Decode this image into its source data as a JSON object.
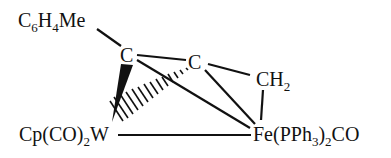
{
  "diagram": {
    "type": "chemical-structure",
    "atoms": {
      "aryl": {
        "main": "C",
        "sub1": "6",
        "mid": "H",
        "sub2": "4",
        "tail": "Me"
      },
      "c1": {
        "label": "C"
      },
      "c2": {
        "label": "C"
      },
      "ch2": {
        "main": "CH",
        "sub": "2"
      },
      "w": {
        "pre": "Cp(CO)",
        "sub": "2",
        "post": "W"
      },
      "fe": {
        "pre": "Fe(PPh",
        "sub1": "3",
        "mid": ")",
        "sub2": "2",
        "post": "CO"
      }
    },
    "bonds": [
      {
        "from": "aryl",
        "to": "c1",
        "style": "single"
      },
      {
        "from": "c1",
        "to": "c2",
        "style": "single"
      },
      {
        "from": "c1",
        "to": "w",
        "style": "wedge"
      },
      {
        "from": "c1",
        "to": "fe",
        "style": "single"
      },
      {
        "from": "c2",
        "to": "ch2",
        "style": "single"
      },
      {
        "from": "c2",
        "to": "fe",
        "style": "single"
      },
      {
        "from": "c2",
        "to": "w",
        "style": "hashed"
      },
      {
        "from": "ch2",
        "to": "fe",
        "style": "single"
      },
      {
        "from": "w",
        "to": "fe",
        "style": "single"
      }
    ]
  }
}
